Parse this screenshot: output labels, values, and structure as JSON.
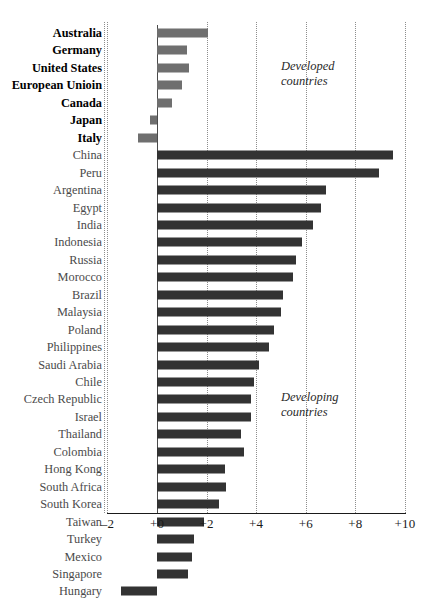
{
  "chart_data": {
    "type": "bar",
    "orientation": "horizontal",
    "title": "",
    "subtitle": "",
    "xlabel": "",
    "ylabel": "",
    "xlim": [
      -2,
      10
    ],
    "xticks": [
      -2,
      0,
      2,
      4,
      6,
      8,
      10
    ],
    "xticklabels": [
      "–2",
      "+0",
      "+2",
      "+4",
      "+6",
      "+8",
      "+10"
    ],
    "grid": "vertical-dotted",
    "legend": "none",
    "categories": [
      "Australia",
      "Germany",
      "United States",
      "European Unioin",
      "Canada",
      "Japan",
      "Italy",
      "China",
      "Peru",
      "Argentina",
      "Egypt",
      "India",
      "Indonesia",
      "Russia",
      "Morocco",
      "Brazil",
      "Malaysia",
      "Poland",
      "Philippines",
      "Saudi Arabia",
      "Chile",
      "Czech Republic",
      "Israel",
      "Thailand",
      "Colombia",
      "Hong Kong",
      "South Africa",
      "South Korea",
      "Taiwan",
      "Turkey",
      "Mexico",
      "Singapore",
      "Hungary"
    ],
    "values": [
      2.05,
      1.2,
      1.3,
      1.0,
      0.6,
      -0.3,
      -0.75,
      9.5,
      8.95,
      6.8,
      6.6,
      6.3,
      5.85,
      5.6,
      5.5,
      5.1,
      5.0,
      4.7,
      4.5,
      4.1,
      3.9,
      3.8,
      3.8,
      3.4,
      3.5,
      2.75,
      2.8,
      2.5,
      1.9,
      1.5,
      1.4,
      1.25,
      -1.45
    ],
    "groups": [
      "developed",
      "developed",
      "developed",
      "developed",
      "developed",
      "developed",
      "developed",
      "developing",
      "developing",
      "developing",
      "developing",
      "developing",
      "developing",
      "developing",
      "developing",
      "developing",
      "developing",
      "developing",
      "developing",
      "developing",
      "developing",
      "developing",
      "developing",
      "developing",
      "developing",
      "developing",
      "developing",
      "developing",
      "developing",
      "developing",
      "developing",
      "developing",
      "developing"
    ],
    "annotations": [
      {
        "name": "developed-countries-annotation",
        "lines": [
          "Developed",
          "countries"
        ],
        "x": 5.0,
        "row": 2
      },
      {
        "name": "developing-countries-annotation",
        "lines": [
          "Developing",
          "countries"
        ],
        "x": 5.0,
        "row": 21
      }
    ],
    "series_colors": {
      "developed": "#6f6f6f",
      "developing": "#333333"
    },
    "background": "#ffffff",
    "axis_color": "#1a1a1a",
    "grid_color": "#8d8d8d"
  }
}
